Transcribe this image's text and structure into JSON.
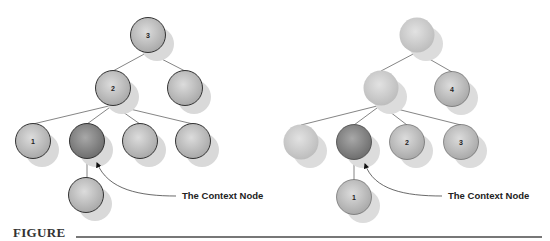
{
  "figure": {
    "caption": "FIGURE",
    "colors": {
      "node_fill": "#c4c4c4",
      "node_fill_light": "#d2d2d2",
      "context_node_fill": "#8c8c8c",
      "node_outline": "#333333",
      "shadow": "#d9d9d9",
      "edge": "#666666"
    }
  },
  "left_diagram": {
    "callout_label": "The Context Node",
    "nodes": [
      {
        "id": "root",
        "label": "3"
      },
      {
        "id": "l2a",
        "label": "2"
      },
      {
        "id": "l2b",
        "label": ""
      },
      {
        "id": "l3a",
        "label": "1"
      },
      {
        "id": "context",
        "label": ""
      },
      {
        "id": "l3c",
        "label": ""
      },
      {
        "id": "l3d",
        "label": ""
      },
      {
        "id": "l4a",
        "label": ""
      }
    ]
  },
  "right_diagram": {
    "callout_label": "The Context Node",
    "nodes": [
      {
        "id": "root",
        "label": ""
      },
      {
        "id": "l2a",
        "label": ""
      },
      {
        "id": "l2b",
        "label": "4"
      },
      {
        "id": "l3a",
        "label": ""
      },
      {
        "id": "context",
        "label": ""
      },
      {
        "id": "l3c",
        "label": "2"
      },
      {
        "id": "l3d",
        "label": "3"
      },
      {
        "id": "l4a",
        "label": "1"
      }
    ]
  }
}
